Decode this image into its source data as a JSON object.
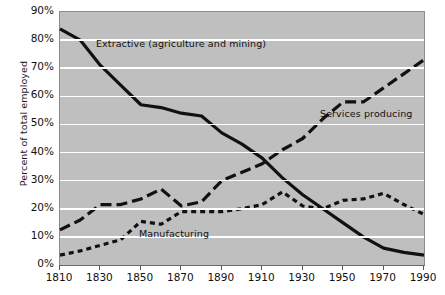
{
  "chart_data": {
    "type": "line",
    "title": "",
    "subtitle": "",
    "xlabel": "",
    "ylabel": "Percent of total employed",
    "xlim": [
      1810,
      1990
    ],
    "ylim": [
      0,
      90
    ],
    "grid": true,
    "legend_position": "inline-annotations",
    "x_ticks": [
      "1810",
      "1830",
      "1850",
      "1870",
      "1890",
      "1910",
      "1930",
      "1950",
      "1970",
      "1990"
    ],
    "x_tick_values": [
      1810,
      1830,
      1850,
      1870,
      1890,
      1910,
      1930,
      1950,
      1970,
      1990
    ],
    "y_ticks": [
      "0%",
      "10%",
      "20%",
      "30%",
      "40%",
      "50%",
      "60%",
      "70%",
      "80%",
      "90%"
    ],
    "y_tick_values": [
      0,
      10,
      20,
      30,
      40,
      50,
      60,
      70,
      80,
      90
    ],
    "x": [
      1810,
      1820,
      1830,
      1840,
      1850,
      1860,
      1870,
      1880,
      1890,
      1900,
      1910,
      1920,
      1930,
      1940,
      1950,
      1960,
      1970,
      1980,
      1990
    ],
    "series": [
      {
        "name": "Extractive (agriculture and mining)",
        "style": "solid",
        "color": "#111111",
        "values": [
          84,
          80,
          71,
          64,
          57,
          56,
          54,
          53,
          47,
          43,
          38,
          31,
          25,
          20,
          15,
          10,
          6,
          4.5,
          3.5
        ]
      },
      {
        "name": "Services producing",
        "style": "long-dash",
        "color": "#111111",
        "values": [
          12.5,
          16,
          21.5,
          21.5,
          23.5,
          27,
          21,
          22.5,
          30,
          33,
          36,
          41,
          45,
          52,
          58,
          58,
          63,
          68,
          73
        ]
      },
      {
        "name": "Manufacturing",
        "style": "short-dash",
        "color": "#111111",
        "values": [
          3.5,
          5,
          7,
          9,
          15.5,
          14.5,
          19,
          19,
          19,
          20,
          21.5,
          26,
          21,
          20,
          23,
          23.5,
          25.5,
          21.5,
          18
        ]
      }
    ],
    "annotations": [
      {
        "text": "Extractive (agriculture and mining)",
        "series": "Extractive (agriculture and mining)"
      },
      {
        "text": "Services producing",
        "series": "Services producing"
      },
      {
        "text": "Manufacturing",
        "series": "Manufacturing"
      }
    ],
    "colors": {
      "plot_background": "#bfbfbf",
      "gridline": "#ffffff",
      "line": "#111111",
      "page_background": "#ffffff",
      "axis": "#6b6b6b"
    }
  }
}
